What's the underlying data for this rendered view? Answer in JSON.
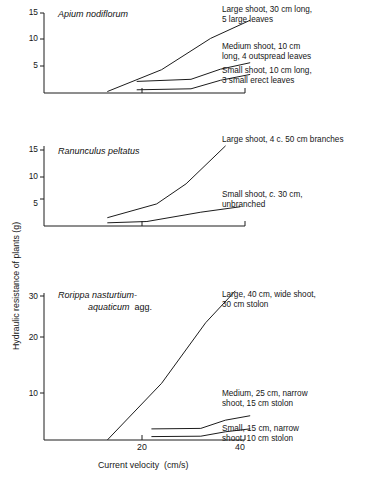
{
  "figure": {
    "axis_label_y": "Hydraulic resistance of plants (g)",
    "axis_label_x": "Current velocity  (cm/s)",
    "x_ticks": [
      "20",
      "40"
    ],
    "x_tick_values": [
      20,
      40
    ]
  },
  "panels": [
    {
      "id": "apium",
      "species_line1": "Apium nodiflorum",
      "species_line2": "",
      "y_ticks": [
        "5",
        "10",
        "15"
      ],
      "y_tick_values": [
        5,
        10,
        15
      ],
      "annotations": [
        "Large shoot, 30 cm long,\n5 large leaves",
        "Medium shoot, 10 cm\nlong, 4 outspread leaves",
        "Small shoot, 10 cm long,\n3 small erect leaves"
      ]
    },
    {
      "id": "ranunculus",
      "species_line1": "Ranunculus peltatus",
      "species_line2": "",
      "y_ticks": [
        "5",
        "10",
        "15"
      ],
      "y_tick_values": [
        5,
        10,
        15
      ],
      "annotations": [
        "Large shoot, 4 c. 50 cm branches",
        "Small shoot, c. 30 cm,\nunbranched"
      ]
    },
    {
      "id": "rorippa",
      "species_line1": "Rorippa nasturtium-",
      "species_line2": "aquaticum  agg.",
      "y_ticks": [
        "10",
        "20",
        "30"
      ],
      "y_tick_values": [
        10,
        20,
        30
      ],
      "annotations": [
        "Large, 40 cm, wide shoot,\n30 cm stolon",
        "Medium, 25 cm, narrow\nshoot, 15 cm stolon",
        "Small, 15 cm, narrow\nshoot, 10 cm stolon"
      ]
    }
  ],
  "chart_data": [
    {
      "type": "line",
      "title": "Apium nodiflorum",
      "xlabel": "Current velocity (cm/s)",
      "ylabel": "Hydraulic resistance of plants (g)",
      "xlim": [
        0,
        42
      ],
      "ylim": [
        0,
        16
      ],
      "grid": false,
      "legend": "inline-annotations-right",
      "series": [
        {
          "name": "Large shoot, 30 cm long, 5 large leaves",
          "x": [
            13,
            24,
            34,
            42
          ],
          "y": [
            0.2,
            4.3,
            10.2,
            13.6
          ]
        },
        {
          "name": "Medium shoot, 10 cm long, 4 outspread leaves",
          "x": [
            19,
            30,
            36,
            42
          ],
          "y": [
            2.1,
            2.5,
            4.4,
            5.6
          ]
        },
        {
          "name": "Small shoot, 10 cm long, 3 small erect leaves",
          "x": [
            19,
            30,
            36,
            42
          ],
          "y": [
            0.5,
            0.7,
            2.3,
            3.4
          ]
        }
      ]
    },
    {
      "type": "line",
      "title": "Ranunculus peltatus",
      "xlabel": "Current velocity (cm/s)",
      "ylabel": "Hydraulic resistance of plants (g)",
      "xlim": [
        0,
        42
      ],
      "ylim": [
        0,
        16
      ],
      "grid": false,
      "legend": "inline-annotations-right",
      "series": [
        {
          "name": "Large shoot, 4 c. 50 cm branches",
          "x": [
            13,
            23,
            29,
            37
          ],
          "y": [
            1.2,
            4.0,
            8.1,
            15.8
          ]
        },
        {
          "name": "Small shoot, c. 30 cm, unbranched",
          "x": [
            13,
            21,
            32,
            40
          ],
          "y": [
            0.15,
            0.4,
            2.3,
            3.4
          ]
        }
      ]
    },
    {
      "type": "line",
      "title": "Rorippa nasturtium-aquaticum agg.",
      "xlabel": "Current velocity (cm/s)",
      "ylabel": "Hydraulic resistance of plants (g)",
      "xlim": [
        0,
        42
      ],
      "ylim": [
        0,
        34
      ],
      "grid": false,
      "legend": "inline-annotations-right",
      "series": [
        {
          "name": "Large, 40 cm, wide shoot, 30 cm stolon",
          "x": [
            13,
            24,
            33,
            39
          ],
          "y": [
            0.4,
            12.0,
            24.5,
            31.0
          ]
        },
        {
          "name": "Medium, 25 cm, narrow shoot, 15 cm stolon",
          "x": [
            22,
            32,
            37,
            42
          ],
          "y": [
            2.6,
            2.7,
            4.4,
            5.3
          ]
        },
        {
          "name": "Small, 15 cm, narrow shoot, 10 cm stolon",
          "x": [
            22,
            32,
            37,
            42
          ],
          "y": [
            1.0,
            1.1,
            2.0,
            2.6
          ]
        }
      ]
    }
  ]
}
